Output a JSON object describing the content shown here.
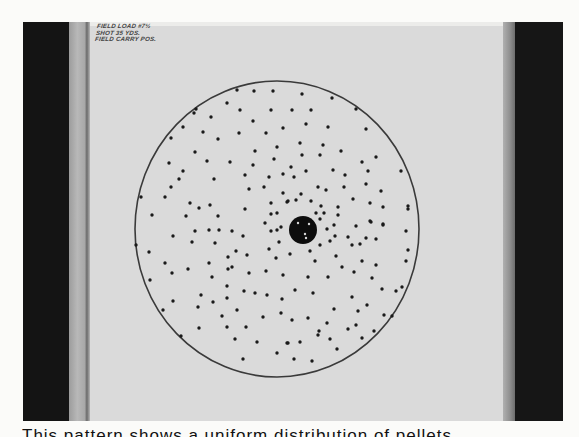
{
  "photo": {
    "description": "Shotgun pattern test target pinned to a board",
    "note_lines": [
      "FIELD LOAD #7½",
      "SHOT 35 YDS.",
      "FIELD CARRY POS."
    ]
  },
  "target": {
    "circle": {
      "cx": 277,
      "cy": 229,
      "rx": 142,
      "ry": 148,
      "stroke": "#3a3a3a"
    },
    "center_blob": {
      "cx": 303,
      "cy": 230,
      "r": 14,
      "color": "#0d0d0d",
      "specks": [
        [
          298,
          223
        ],
        [
          309,
          224
        ],
        [
          305,
          234
        ],
        [
          306,
          238
        ]
      ]
    },
    "pellet_color": "#1a1a1a",
    "pellets": [
      [
        237,
        90
      ],
      [
        254,
        91
      ],
      [
        273,
        91
      ],
      [
        227,
        103
      ],
      [
        240,
        110
      ],
      [
        271,
        110
      ],
      [
        196,
        109
      ],
      [
        194,
        113
      ],
      [
        211,
        117
      ],
      [
        253,
        121
      ],
      [
        183,
        127
      ],
      [
        203,
        132
      ],
      [
        239,
        133
      ],
      [
        266,
        133
      ],
      [
        283,
        128
      ],
      [
        171,
        138
      ],
      [
        218,
        139
      ],
      [
        195,
        152
      ],
      [
        255,
        151
      ],
      [
        277,
        147
      ],
      [
        207,
        161
      ],
      [
        230,
        162
      ],
      [
        274,
        159
      ],
      [
        169,
        163
      ],
      [
        253,
        165
      ],
      [
        183,
        171
      ],
      [
        179,
        179
      ],
      [
        214,
        179
      ],
      [
        245,
        175
      ],
      [
        269,
        177
      ],
      [
        283,
        174
      ],
      [
        171,
        187
      ],
      [
        249,
        189
      ],
      [
        264,
        187
      ],
      [
        141,
        197
      ],
      [
        165,
        197
      ],
      [
        283,
        193
      ],
      [
        190,
        203
      ],
      [
        210,
        205
      ],
      [
        199,
        208
      ],
      [
        245,
        209
      ],
      [
        271,
        203
      ],
      [
        287,
        202
      ],
      [
        152,
        215
      ],
      [
        186,
        216
      ],
      [
        218,
        216
      ],
      [
        271,
        214
      ],
      [
        277,
        213
      ],
      [
        265,
        223
      ],
      [
        302,
        94
      ],
      [
        332,
        98
      ],
      [
        292,
        110
      ],
      [
        311,
        110
      ],
      [
        356,
        109
      ],
      [
        306,
        124
      ],
      [
        328,
        127
      ],
      [
        366,
        129
      ],
      [
        300,
        143
      ],
      [
        323,
        145
      ],
      [
        341,
        151
      ],
      [
        302,
        155
      ],
      [
        320,
        155
      ],
      [
        376,
        157
      ],
      [
        362,
        162
      ],
      [
        291,
        167
      ],
      [
        306,
        171
      ],
      [
        333,
        170
      ],
      [
        368,
        171
      ],
      [
        401,
        171
      ],
      [
        294,
        177
      ],
      [
        345,
        175
      ],
      [
        318,
        187
      ],
      [
        326,
        190
      ],
      [
        344,
        187
      ],
      [
        366,
        184
      ],
      [
        381,
        191
      ],
      [
        301,
        194
      ],
      [
        288,
        201
      ],
      [
        296,
        200
      ],
      [
        311,
        201
      ],
      [
        353,
        199
      ],
      [
        370,
        203
      ],
      [
        321,
        206
      ],
      [
        338,
        207
      ],
      [
        383,
        207
      ],
      [
        408,
        206
      ],
      [
        408,
        209
      ],
      [
        316,
        213
      ],
      [
        324,
        213
      ],
      [
        338,
        215
      ],
      [
        320,
        219
      ],
      [
        370,
        221
      ],
      [
        383,
        224
      ],
      [
        334,
        225
      ],
      [
        356,
        226
      ],
      [
        271,
        231
      ],
      [
        277,
        230
      ],
      [
        281,
        227
      ],
      [
        173,
        236
      ],
      [
        195,
        231
      ],
      [
        209,
        230
      ],
      [
        219,
        230
      ],
      [
        232,
        231
      ],
      [
        243,
        236
      ],
      [
        136,
        245
      ],
      [
        192,
        242
      ],
      [
        215,
        243
      ],
      [
        279,
        242
      ],
      [
        149,
        252
      ],
      [
        236,
        251
      ],
      [
        247,
        255
      ],
      [
        269,
        249
      ],
      [
        228,
        257
      ],
      [
        276,
        258
      ],
      [
        165,
        263
      ],
      [
        209,
        263
      ],
      [
        188,
        269
      ],
      [
        228,
        269
      ],
      [
        232,
        267
      ],
      [
        172,
        273
      ],
      [
        249,
        273
      ],
      [
        266,
        271
      ],
      [
        283,
        275
      ],
      [
        212,
        277
      ],
      [
        150,
        280
      ],
      [
        227,
        286
      ],
      [
        244,
        291
      ],
      [
        255,
        293
      ],
      [
        201,
        295
      ],
      [
        227,
        298
      ],
      [
        267,
        295
      ],
      [
        282,
        299
      ],
      [
        173,
        301
      ],
      [
        213,
        302
      ],
      [
        198,
        307
      ],
      [
        237,
        310
      ],
      [
        163,
        310
      ],
      [
        281,
        313
      ],
      [
        222,
        316
      ],
      [
        263,
        317
      ],
      [
        199,
        328
      ],
      [
        227,
        327
      ],
      [
        246,
        327
      ],
      [
        181,
        336
      ],
      [
        235,
        339
      ],
      [
        257,
        342
      ],
      [
        287,
        343
      ],
      [
        277,
        353
      ],
      [
        243,
        359
      ],
      [
        327,
        229
      ],
      [
        371,
        222
      ],
      [
        383,
        225
      ],
      [
        406,
        231
      ],
      [
        335,
        236
      ],
      [
        348,
        237
      ],
      [
        366,
        238
      ],
      [
        376,
        239
      ],
      [
        330,
        241
      ],
      [
        352,
        245
      ],
      [
        360,
        244
      ],
      [
        320,
        245
      ],
      [
        408,
        250
      ],
      [
        290,
        254
      ],
      [
        310,
        251
      ],
      [
        336,
        256
      ],
      [
        406,
        261
      ],
      [
        315,
        261
      ],
      [
        362,
        261
      ],
      [
        376,
        265
      ],
      [
        342,
        267
      ],
      [
        354,
        272
      ],
      [
        308,
        277
      ],
      [
        328,
        277
      ],
      [
        372,
        278
      ],
      [
        402,
        287
      ],
      [
        396,
        291
      ],
      [
        382,
        289
      ],
      [
        295,
        290
      ],
      [
        313,
        293
      ],
      [
        352,
        297
      ],
      [
        367,
        305
      ],
      [
        334,
        309
      ],
      [
        358,
        311
      ],
      [
        384,
        315
      ],
      [
        308,
        318
      ],
      [
        292,
        320
      ],
      [
        327,
        323
      ],
      [
        356,
        325
      ],
      [
        392,
        316
      ],
      [
        319,
        331
      ],
      [
        318,
        335
      ],
      [
        348,
        329
      ],
      [
        374,
        331
      ],
      [
        330,
        339
      ],
      [
        362,
        338
      ],
      [
        288,
        343
      ],
      [
        300,
        342
      ],
      [
        337,
        349
      ],
      [
        294,
        359
      ],
      [
        312,
        361
      ]
    ]
  },
  "caption": {
    "text": "This pattern shows a uniform distribution of pellets",
    "clipped": true
  }
}
